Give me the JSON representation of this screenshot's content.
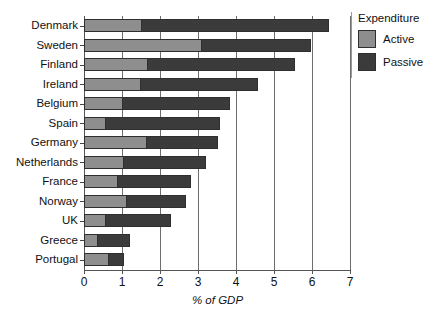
{
  "chart_data": {
    "type": "bar",
    "orientation": "horizontal",
    "stacked": true,
    "title": "",
    "xlabel": "% of GDP",
    "ylabel": "",
    "xlim": [
      0,
      7
    ],
    "xticks": [
      0,
      1,
      2,
      3,
      4,
      5,
      6,
      7
    ],
    "xticklabels": [
      "0",
      "1",
      "2",
      "3",
      "4",
      "5",
      "6",
      "7"
    ],
    "grid": "vertical",
    "legend": {
      "title": "Expenditure",
      "position": "right",
      "entries": [
        {
          "name": "Active",
          "color": "#8e8e8e"
        },
        {
          "name": "Passive",
          "color": "#3b3b3b"
        }
      ]
    },
    "categories": [
      "Denmark",
      "Sweden",
      "Finland",
      "Ireland",
      "Belgium",
      "Spain",
      "Germany",
      "Netherlands",
      "France",
      "Norway",
      "UK",
      "Greece",
      "Portugal"
    ],
    "series": [
      {
        "name": "Active",
        "color": "#8e8e8e",
        "values": [
          1.5,
          3.08,
          1.65,
          1.47,
          1.0,
          0.55,
          1.63,
          1.03,
          0.87,
          1.1,
          0.55,
          0.35,
          0.63
        ]
      },
      {
        "name": "Passive",
        "color": "#3b3b3b",
        "values": [
          4.95,
          2.89,
          3.9,
          3.11,
          2.84,
          3.03,
          1.89,
          2.18,
          1.95,
          1.58,
          1.75,
          0.85,
          0.42
        ]
      }
    ],
    "totals": [
      6.45,
      5.97,
      5.55,
      4.58,
      3.84,
      3.58,
      3.52,
      3.21,
      2.82,
      2.68,
      2.3,
      1.2,
      1.05
    ]
  },
  "colors": {
    "active": "#8e8e8e",
    "passive": "#3b3b3b",
    "axis": "#555555",
    "grid": "#6e6e6e",
    "background": "#ffffff"
  }
}
